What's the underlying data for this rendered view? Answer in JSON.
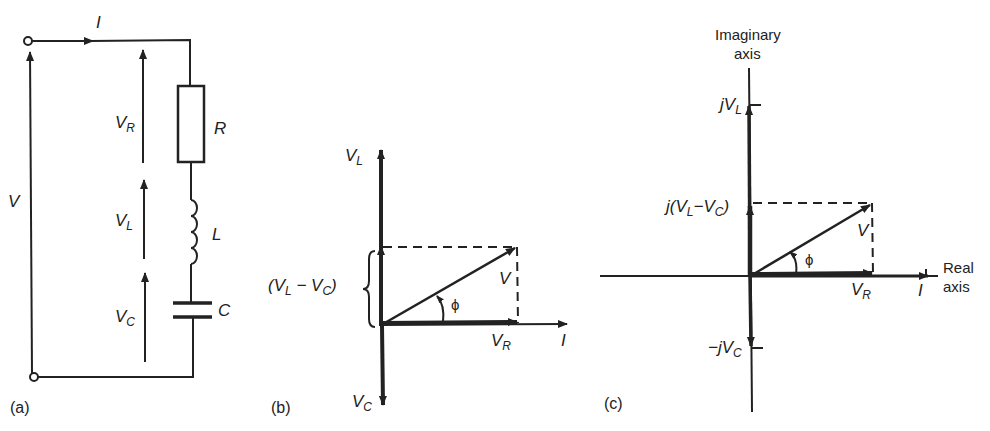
{
  "panel_a": {
    "tag": "(a)",
    "current_label": "I",
    "source_voltage_label": "V",
    "components": [
      {
        "symbol": "R",
        "type": "resistor"
      },
      {
        "symbol": "L",
        "type": "inductor"
      },
      {
        "symbol": "C",
        "type": "capacitor"
      }
    ],
    "voltage_drops": [
      {
        "main": "V",
        "sub": "R"
      },
      {
        "main": "V",
        "sub": "L"
      },
      {
        "main": "V",
        "sub": "C"
      }
    ]
  },
  "panel_b": {
    "tag": "(b)",
    "vl_label": {
      "main": "V",
      "sub": "L"
    },
    "vc_label": {
      "main": "V",
      "sub": "C"
    },
    "vr_label": {
      "main": "V",
      "sub": "R"
    },
    "v_label": "V",
    "i_label": "I",
    "phi_label": "ϕ",
    "brace_label": {
      "open": "(V",
      "sub1": "L",
      "mid": " − V",
      "sub2": "C",
      "close": ")"
    }
  },
  "panel_c": {
    "tag": "(c)",
    "imag_axis_label": [
      "Imaginary",
      "axis"
    ],
    "real_axis_label": [
      "Real",
      "axis"
    ],
    "jvl_label": {
      "main": "jV",
      "sub": "L"
    },
    "jdiff_label": {
      "open": "j(V",
      "sub1": "L",
      "mid": "−V",
      "sub2": "C",
      "close": ")"
    },
    "neg_jvc_label": {
      "main": "−jV",
      "sub": "C"
    },
    "vr_label": {
      "main": "V",
      "sub": "R"
    },
    "v_label": "V",
    "i_label": "I",
    "phi_label": "ϕ"
  }
}
